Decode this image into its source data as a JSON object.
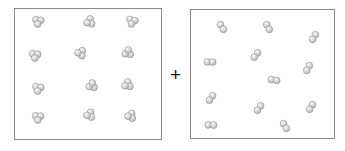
{
  "figure": {
    "title": "",
    "operator_symbol": "+",
    "background_color": "#ffffff",
    "border_color": "#8a8a8a",
    "sphere_fill_color": "#d9d9d9",
    "sphere_highlight_color": "#f2f2f2",
    "sphere_shadow_color": "#a8a8a8",
    "sphere_outline_color": "#8e8e8e"
  },
  "operator": {
    "symbol": "+",
    "x": 170,
    "y": 65,
    "font_size": 19
  },
  "boxes": [
    {
      "name": "left-reactant-box",
      "label": "",
      "x": 14,
      "y": 8,
      "width": 148,
      "height": 132,
      "molecule_type": "triatomic",
      "atoms_per_molecule": 3,
      "molecule_count": 12,
      "atom_radius": 3.4,
      "bond_length": 5.0
    },
    {
      "name": "right-reactant-box",
      "label": "",
      "x": 190,
      "y": 9,
      "width": 145,
      "height": 130,
      "molecule_type": "diatomic",
      "atoms_per_molecule": 2,
      "molecule_count": 12,
      "atom_radius": 3.4,
      "bond_length": 5.4
    }
  ],
  "chart_data": {
    "type": "scatter",
    "title": "",
    "subtitle": "",
    "xlabel": "",
    "ylabel": "",
    "grid": false,
    "legend": "none",
    "series": [
      {
        "name": "left-box-triatomic-molecules",
        "box": "left-reactant-box",
        "atoms_per_molecule": 3,
        "count": 12,
        "molecules": [
          {
            "id": "L1",
            "cx": 38,
            "cy": 22,
            "rotation": 8
          },
          {
            "id": "L2",
            "cx": 89,
            "cy": 22,
            "rotation": 72
          },
          {
            "id": "L3",
            "cx": 132,
            "cy": 22,
            "rotation": 14
          },
          {
            "id": "L4",
            "cx": 35,
            "cy": 56,
            "rotation": 6
          },
          {
            "id": "L5",
            "cx": 80,
            "cy": 53,
            "rotation": 95
          },
          {
            "id": "L6",
            "cx": 128,
            "cy": 52,
            "rotation": 186
          },
          {
            "id": "L7",
            "cx": 38,
            "cy": 89,
            "rotation": 10
          },
          {
            "id": "L8",
            "cx": 92,
            "cy": 85,
            "rotation": 188
          },
          {
            "id": "L9",
            "cx": 127,
            "cy": 85,
            "rotation": 66
          },
          {
            "id": "L10",
            "cx": 38,
            "cy": 118,
            "rotation": 4
          },
          {
            "id": "L11",
            "cx": 89,
            "cy": 115,
            "rotation": 80
          },
          {
            "id": "L12",
            "cx": 130,
            "cy": 116,
            "rotation": 84
          }
        ]
      },
      {
        "name": "right-box-diatomic-molecules",
        "box": "right-reactant-box",
        "atoms_per_molecule": 2,
        "count": 12,
        "molecules": [
          {
            "id": "R1",
            "cx": 222,
            "cy": 27,
            "rotation": 58
          },
          {
            "id": "R2",
            "cx": 268,
            "cy": 27,
            "rotation": 62
          },
          {
            "id": "R3",
            "cx": 314,
            "cy": 37,
            "rotation": 122
          },
          {
            "id": "R4",
            "cx": 210,
            "cy": 62,
            "rotation": 2
          },
          {
            "id": "R5",
            "cx": 256,
            "cy": 55,
            "rotation": 128
          },
          {
            "id": "R6",
            "cx": 308,
            "cy": 68,
            "rotation": 118
          },
          {
            "id": "R7",
            "cx": 274,
            "cy": 80,
            "rotation": 10
          },
          {
            "id": "R8",
            "cx": 211,
            "cy": 98,
            "rotation": 126
          },
          {
            "id": "R9",
            "cx": 259,
            "cy": 108,
            "rotation": 126
          },
          {
            "id": "R10",
            "cx": 311,
            "cy": 107,
            "rotation": 122
          },
          {
            "id": "R11",
            "cx": 211,
            "cy": 125,
            "rotation": 2
          },
          {
            "id": "R12",
            "cx": 285,
            "cy": 126,
            "rotation": 58
          }
        ]
      }
    ]
  }
}
